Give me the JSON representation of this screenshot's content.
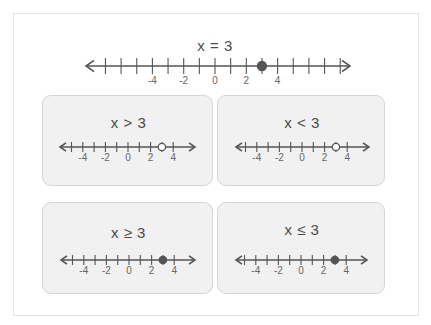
{
  "main": {
    "title": "x = 3",
    "number_line": {
      "tick_min": -7,
      "tick_max": 8,
      "labels": [
        "-4",
        "-2",
        "0",
        "2",
        "4"
      ],
      "label_values": [
        -4,
        -2,
        0,
        2,
        4
      ],
      "point": 3,
      "point_style": "closed",
      "direction": "both"
    }
  },
  "panels": [
    {
      "title": "x > 3",
      "point": 3,
      "point_style": "open",
      "labels": [
        "-4",
        "-2",
        "0",
        "2",
        "4"
      ]
    },
    {
      "title": "x < 3",
      "point": 3,
      "point_style": "open",
      "labels": [
        "-4",
        "-2",
        "0",
        "2",
        "4"
      ]
    },
    {
      "title": "x ≥ 3",
      "point": 3,
      "point_style": "closed",
      "labels": [
        "-4",
        "-2",
        "0",
        "2",
        "4"
      ]
    },
    {
      "title": "x ≤ 3",
      "point": 3,
      "point_style": "closed",
      "labels": [
        "-4",
        "-2",
        "0",
        "2",
        "4"
      ]
    }
  ],
  "colors": {
    "line": "#555555",
    "panel_bg": "#f1f1f1",
    "panel_border": "#d6d6d6"
  }
}
